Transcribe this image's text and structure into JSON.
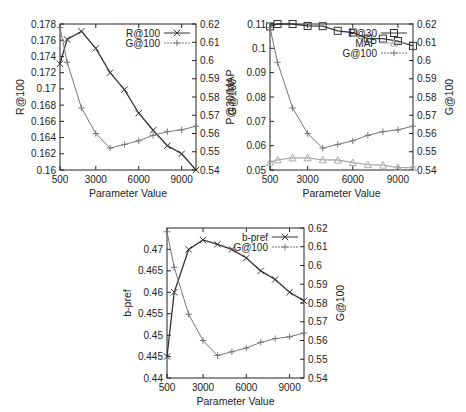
{
  "chart_data": [
    {
      "type": "line",
      "id": "chart1",
      "xlabel": "Parameter Value",
      "ylabel": "R@100",
      "y2label": "G@100",
      "x": [
        500,
        1000,
        2000,
        3000,
        4000,
        5000,
        6000,
        7000,
        8000,
        9000,
        10000
      ],
      "xticks": [
        500,
        3000,
        6000,
        9000
      ],
      "xlim": [
        500,
        10000
      ],
      "ylim": [
        0.16,
        0.178
      ],
      "yticks": [
        "0.16",
        "0.162",
        "0.164",
        "0.166",
        "0.168",
        "0.17",
        "0.172",
        "0.174",
        "0.176",
        "0.178"
      ],
      "y2lim": [
        0.54,
        0.62
      ],
      "y2ticks": [
        "0.54",
        "0.55",
        "0.56",
        "0.57",
        "0.58",
        "0.59",
        "0.6",
        "0.61",
        "0.62"
      ],
      "series": [
        {
          "name": "R@100",
          "axis": "left",
          "marker": "x",
          "color": "#333333",
          "values": [
            0.1731,
            0.1761,
            0.1771,
            0.175,
            0.172,
            0.1699,
            0.167,
            0.1649,
            0.163,
            0.162,
            0.16
          ]
        },
        {
          "name": "G@100",
          "axis": "right",
          "marker": "+",
          "color": "#777777",
          "values": [
            0.618,
            0.599,
            0.574,
            0.56,
            0.552,
            0.554,
            0.556,
            0.559,
            0.561,
            0.562,
            0.564
          ]
        }
      ],
      "legend": [
        "R@100",
        "G@100"
      ],
      "legend_position": "top-right"
    },
    {
      "type": "line",
      "id": "chart2",
      "xlabel": "Parameter Value",
      "ylabel": "P@30/MAP",
      "y2label": "G@100",
      "x": [
        500,
        1000,
        2000,
        3000,
        4000,
        5000,
        6000,
        7000,
        8000,
        9000,
        10000
      ],
      "xticks": [
        500,
        3000,
        6000,
        9000
      ],
      "xlim": [
        500,
        10000
      ],
      "ylim": [
        0.05,
        0.11
      ],
      "yticks": [
        "0.05",
        "0.06",
        "0.07",
        "0.08",
        "0.09",
        "0.1",
        "0.11"
      ],
      "y2lim": [
        0.54,
        0.62
      ],
      "y2ticks": [
        "0.54",
        "0.55",
        "0.56",
        "0.57",
        "0.58",
        "0.59",
        "0.6",
        "0.61",
        "0.62"
      ],
      "series": [
        {
          "name": "P@30",
          "axis": "left",
          "marker": "square",
          "color": "#333333",
          "values": [
            0.109,
            0.11,
            0.11,
            0.1092,
            0.1091,
            0.1072,
            0.1065,
            0.104,
            0.104,
            0.103,
            0.101
          ]
        },
        {
          "name": "MAP",
          "axis": "left",
          "marker": "triangle",
          "color": "#aaaaaa",
          "values": [
            0.0532,
            0.0542,
            0.055,
            0.055,
            0.0542,
            0.0541,
            0.053,
            0.0522,
            0.052,
            0.051,
            0.051
          ]
        },
        {
          "name": "G@100",
          "axis": "right",
          "marker": "+",
          "color": "#777777",
          "values": [
            0.618,
            0.599,
            0.574,
            0.56,
            0.552,
            0.554,
            0.556,
            0.559,
            0.561,
            0.562,
            0.564
          ]
        }
      ],
      "legend": [
        "P@30",
        "MAP",
        "G@100"
      ],
      "legend_position": "top-right"
    },
    {
      "type": "line",
      "id": "chart3",
      "xlabel": "Parameter Value",
      "ylabel": "b-pref",
      "y2label": "G@100",
      "x": [
        500,
        1000,
        2000,
        3000,
        4000,
        5000,
        6000,
        7000,
        8000,
        9000,
        10000
      ],
      "xticks": [
        500,
        3000,
        6000,
        9000
      ],
      "xlim": [
        500,
        10000
      ],
      "ylim": [
        0.44,
        0.475
      ],
      "yticks": [
        "0.44",
        "0.445",
        "0.45",
        "0.455",
        "0.46",
        "0.465",
        "0.47"
      ],
      "y2lim": [
        0.54,
        0.62
      ],
      "y2ticks": [
        "0.54",
        "0.55",
        "0.56",
        "0.57",
        "0.58",
        "0.59",
        "0.6",
        "0.61",
        "0.62"
      ],
      "series": [
        {
          "name": "b-pref",
          "axis": "left",
          "marker": "x",
          "color": "#333333",
          "values": [
            0.445,
            0.46,
            0.47,
            0.4722,
            0.4712,
            0.47,
            0.468,
            0.465,
            0.463,
            0.46,
            0.458
          ]
        },
        {
          "name": "G@100",
          "axis": "right",
          "marker": "+",
          "color": "#777777",
          "values": [
            0.618,
            0.599,
            0.574,
            0.56,
            0.552,
            0.554,
            0.556,
            0.559,
            0.561,
            0.562,
            0.564
          ]
        }
      ],
      "legend": [
        "b-pref",
        "G@100"
      ],
      "legend_position": "top-right"
    }
  ],
  "layout": [
    {
      "left": 60,
      "right": 196,
      "top": 24,
      "bottom": 170
    },
    {
      "left": 270,
      "right": 413,
      "top": 24,
      "bottom": 170
    },
    {
      "left": 167,
      "right": 304,
      "top": 228,
      "bottom": 378
    }
  ]
}
